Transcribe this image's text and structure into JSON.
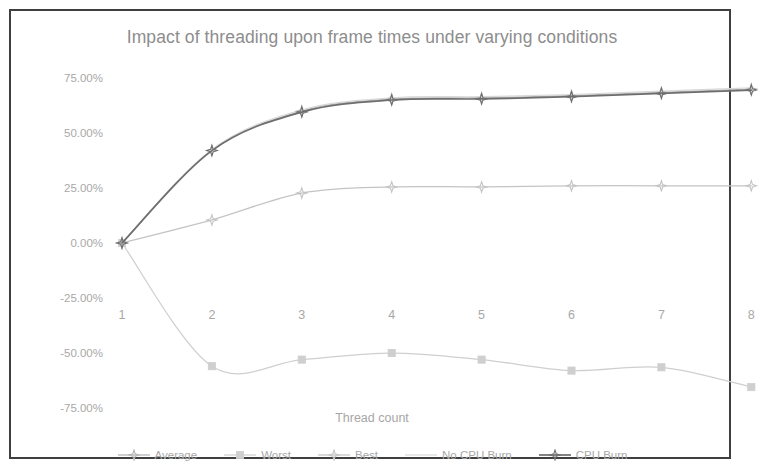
{
  "chart_data": {
    "type": "line",
    "title": "Impact of threading upon frame times under varying conditions",
    "xlabel": "Thread count",
    "ylabel": "Percent improvement",
    "x": [
      1,
      2,
      3,
      4,
      5,
      6,
      7,
      8
    ],
    "xticklabels": [
      "1",
      "2",
      "3",
      "4",
      "5",
      "6",
      "7",
      "8"
    ],
    "yticklabels": [
      "75.00%",
      "50.00%",
      "25.00%",
      "0.00%",
      "-25.00%",
      "-50.00%",
      "-75.00%"
    ],
    "ytickvalues": [
      75,
      50,
      25,
      0,
      -25,
      -50,
      -75
    ],
    "ylim": [
      -75,
      75
    ],
    "xlim": [
      1,
      8
    ],
    "grid": false,
    "legend_position": "bottom",
    "series": [
      {
        "name": "Average",
        "color": "#b3b3b3",
        "marker": "star",
        "values": [
          0,
          42,
          60,
          65.5,
          66,
          67,
          68.5,
          70
        ]
      },
      {
        "name": "Worst",
        "color": "#cfcfcf",
        "marker": "square",
        "values": [
          0,
          -56,
          -53,
          -50,
          -53,
          -58,
          -56.5,
          -65.5
        ]
      },
      {
        "name": "Best",
        "color": "#c4c4c4",
        "marker": "star",
        "values": [
          0,
          10.5,
          22.7,
          25.5,
          25.5,
          26,
          26,
          26
        ]
      },
      {
        "name": "No CPU Burn",
        "color": "#d8d8d8",
        "marker": "none",
        "values": [
          0,
          42.5,
          60.5,
          66,
          66.5,
          67.5,
          69,
          70.5
        ]
      },
      {
        "name": "CPU Burn",
        "color": "#6e6e6e",
        "marker": "star",
        "values": [
          0,
          42,
          59.5,
          65,
          65.5,
          66.5,
          68,
          69.5
        ]
      }
    ]
  },
  "colors": {
    "frame_border": "#3f3f3f",
    "title_text": "#8d8d8d",
    "tick_text": "#a8a8a8",
    "background": "#ffffff"
  }
}
